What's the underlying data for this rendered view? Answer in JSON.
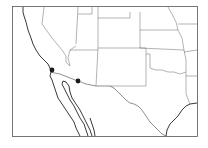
{
  "map": {
    "region": "Southwestern United States and northern Mexico",
    "colors": {
      "background": "#ffffff",
      "lines": "#666666",
      "coastline": "#222222",
      "markers": "#1a1a1a"
    },
    "markers": [
      {
        "name": "marker-1",
        "approx_location": "Southern California coast (San Diego area)",
        "x": 52,
        "y": 70
      },
      {
        "name": "marker-2",
        "approx_location": "Southern Arizona near border",
        "x": 78,
        "y": 81
      }
    ]
  }
}
